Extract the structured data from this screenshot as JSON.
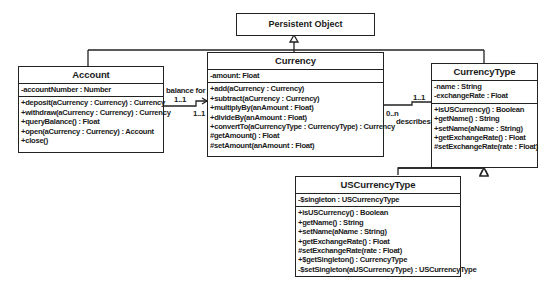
{
  "diagram": {
    "type": "UML class diagram",
    "root": {
      "name": "Persistent Object"
    },
    "classes": {
      "account": {
        "name": "Account",
        "attributes": [
          "-accountNumber : Number"
        ],
        "operations": [
          "+deposit(aCurrency : Currency) : Currency",
          "+withdraw(aCurrency : Currency) : Currency",
          "+queryBalance() : Float",
          "+open(aCurrency : Currency) : Account",
          "+close()"
        ]
      },
      "currency": {
        "name": "Currency",
        "attributes": [
          "-amount: Float"
        ],
        "operations": [
          "+add(aCurrency : Currency)",
          "+subtract(aCurrency : Currency)",
          "+multiplyBy(anAmount : Float)",
          "+divideBy(anAmount : Float)",
          "+convertTo(aCurrencyType : CurrencyType) : Currency",
          "#getAmount() : Float",
          "#setAmount(anAmount : Float)"
        ]
      },
      "currencyType": {
        "name": "CurrencyType",
        "attributes": [
          "-name : String",
          "-exchangeRate : Float"
        ],
        "operations": [
          "+isUSCurrency() : Boolean",
          "+getName() : String",
          "+setName(aName : String)",
          "+getExchangeRate() : Float",
          "#setExchangeRate(rate : Float)"
        ]
      },
      "usCurrencyType": {
        "name": "USCurrencyType",
        "attributes": [
          "-$singleton : USCurrencyType"
        ],
        "operations": [
          "+isUSCurrency() : Boolean",
          "+getName() : String",
          "+setName(aName : String)",
          "+getExchangeRate() : Float",
          "#setExchangeRate(rate : Float)",
          "+$getSingleton() : CurrencyType",
          "-$setSingleton(aUSCurrencyType) : USCurrencyType"
        ]
      }
    },
    "associations": {
      "balance": {
        "name": "balance for",
        "source_mult": "1..1",
        "target_mult": "1..1"
      },
      "describes": {
        "name": "describes",
        "source_mult": "0..n",
        "target_mult": "1..1"
      }
    }
  }
}
